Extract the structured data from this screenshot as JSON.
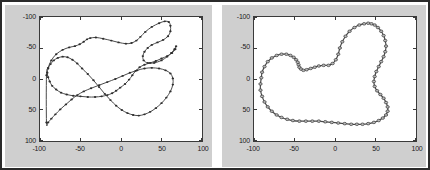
{
  "figure": {
    "background_color": "#cfcfcf",
    "axes_background_color": "#ffffff",
    "border_color": "#2b2b2b",
    "curve_color": "#4a4a4a",
    "marker_color": "#2e2e2e"
  },
  "panels": [
    {
      "id": "left-panel",
      "name": "initial-contour-plot",
      "axis": {
        "x_ticks": [
          "-100",
          "-50",
          "0",
          "50",
          "100"
        ],
        "y_ticks": [
          "-100",
          "-50",
          "0",
          "50",
          "100"
        ],
        "xlim": [
          -100,
          100
        ],
        "ylim": [
          -100,
          100
        ],
        "y_axis_reversed": true,
        "grid": false
      }
    },
    {
      "id": "right-panel",
      "name": "converged-contour-plot",
      "axis": {
        "x_ticks": [
          "-100",
          "-50",
          "0",
          "50",
          "100"
        ],
        "y_ticks": [
          "-100",
          "-50",
          "0",
          "50",
          "100"
        ],
        "xlim": [
          -100,
          100
        ],
        "ylim": [
          -100,
          100
        ],
        "y_axis_reversed": true,
        "grid": false
      }
    }
  ],
  "chart_data": [
    {
      "type": "line",
      "title": "",
      "xlabel": "",
      "ylabel": "",
      "xlim": [
        -100,
        100
      ],
      "ylim": [
        100,
        -100
      ],
      "grid": false,
      "legend": null,
      "marker": "dot",
      "closed": true,
      "series": [
        {
          "name": "initial-snake-contour",
          "x": [
            -92,
            -90,
            -86,
            -80,
            -72,
            -64,
            -57,
            -51,
            -46,
            -42,
            -38,
            -31,
            -22,
            -12,
            -3,
            6,
            13,
            19,
            24,
            30,
            38,
            47,
            54,
            59,
            61,
            61,
            58,
            52,
            45,
            38,
            33,
            29,
            27,
            28,
            33,
            41,
            50,
            57,
            62,
            66,
            68,
            67,
            63,
            57,
            50,
            43,
            36,
            29,
            23,
            18,
            14,
            10,
            5,
            -1,
            -6,
            -11,
            -17,
            -24,
            -32,
            -41,
            -50,
            -59,
            -67,
            -74,
            -80,
            -85,
            -88,
            -90,
            -91,
            -90,
            -87,
            -83,
            -78,
            -72,
            -66,
            -60,
            -54,
            -48,
            -41,
            -34,
            -27,
            -20,
            -13,
            -6,
            1,
            8,
            15,
            22,
            29,
            36,
            43,
            50,
            56,
            61,
            64,
            64,
            61,
            55,
            47,
            38,
            29,
            20,
            11,
            2,
            -7,
            -17,
            -27,
            -37,
            -46,
            -54,
            -61,
            -68,
            -75,
            -81,
            -86,
            -90,
            -92
          ],
          "y": [
            -6,
            -18,
            -30,
            -40,
            -47,
            -51,
            -53,
            -56,
            -60,
            -64,
            -66,
            -67,
            -65,
            -62,
            -59,
            -57,
            -58,
            -62,
            -68,
            -76,
            -84,
            -90,
            -93,
            -92,
            -86,
            -77,
            -69,
            -63,
            -59,
            -55,
            -50,
            -44,
            -37,
            -30,
            -26,
            -26,
            -30,
            -36,
            -42,
            -48,
            -53,
            -48,
            -42,
            -37,
            -33,
            -29,
            -26,
            -23,
            -19,
            -13,
            -6,
            1,
            8,
            14,
            19,
            23,
            26,
            28,
            29,
            29,
            28,
            27,
            25,
            22,
            17,
            11,
            4,
            -3,
            -10,
            -17,
            -24,
            -30,
            -34,
            -36,
            -35,
            -31,
            -25,
            -17,
            -8,
            2,
            13,
            24,
            34,
            43,
            50,
            55,
            58,
            59,
            57,
            53,
            47,
            39,
            30,
            20,
            9,
            -1,
            -9,
            -14,
            -17,
            -18,
            -17,
            -14,
            -10,
            -5,
            0,
            5,
            10,
            15,
            20,
            26,
            33,
            41,
            49,
            57,
            64,
            70,
            70
          ]
        }
      ]
    },
    {
      "type": "line",
      "title": "",
      "xlabel": "",
      "ylabel": "",
      "xlim": [
        -100,
        100
      ],
      "ylim": [
        100,
        -100
      ],
      "grid": false,
      "legend": null,
      "marker": "circle",
      "closed": true,
      "series": [
        {
          "name": "converged-snake-contour",
          "x": [
            -91,
            -90,
            -87,
            -83,
            -78,
            -72,
            -66,
            -60,
            -55,
            -51,
            -48,
            -46,
            -45,
            -44,
            -42,
            -39,
            -35,
            -30,
            -25,
            -20,
            -14,
            -8,
            -3,
            1,
            4,
            6,
            9,
            13,
            18,
            24,
            30,
            36,
            41,
            45,
            49,
            53,
            57,
            60,
            62,
            63,
            62,
            60,
            57,
            54,
            51,
            49,
            48,
            49,
            52,
            56,
            60,
            63,
            65,
            65,
            63,
            59,
            54,
            48,
            41,
            34,
            27,
            20,
            12,
            4,
            -4,
            -12,
            -20,
            -28,
            -36,
            -44,
            -52,
            -59,
            -66,
            -72,
            -78,
            -83,
            -87,
            -90,
            -92,
            -92
          ],
          "y": [
            -2,
            -11,
            -20,
            -28,
            -34,
            -38,
            -40,
            -40,
            -38,
            -35,
            -31,
            -27,
            -23,
            -19,
            -16,
            -14,
            -15,
            -17,
            -19,
            -21,
            -22,
            -22,
            -25,
            -31,
            -40,
            -50,
            -60,
            -69,
            -77,
            -83,
            -87,
            -89,
            -90,
            -89,
            -87,
            -83,
            -77,
            -70,
            -62,
            -53,
            -44,
            -36,
            -28,
            -20,
            -12,
            -4,
            4,
            12,
            19,
            25,
            31,
            38,
            45,
            52,
            58,
            63,
            67,
            70,
            72,
            73,
            73,
            73,
            72,
            71,
            70,
            69,
            68,
            68,
            68,
            68,
            67,
            65,
            62,
            58,
            52,
            45,
            37,
            28,
            18,
            8
          ]
        }
      ]
    }
  ]
}
